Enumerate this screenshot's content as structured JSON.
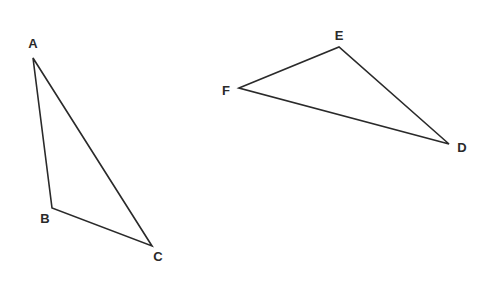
{
  "diagram": {
    "stroke_color": "#2a2a2a",
    "background": "#ffffff",
    "triangles": [
      {
        "name": "ABC",
        "vertices": [
          {
            "label": "A",
            "x": 33,
            "y": 58,
            "lx": 33,
            "ly": 48
          },
          {
            "label": "B",
            "x": 52,
            "y": 208,
            "lx": 45,
            "ly": 223
          },
          {
            "label": "C",
            "x": 152,
            "y": 246,
            "lx": 158,
            "ly": 261
          }
        ]
      },
      {
        "name": "DEF",
        "vertices": [
          {
            "label": "F",
            "x": 239,
            "y": 88,
            "lx": 226,
            "ly": 95
          },
          {
            "label": "E",
            "x": 339,
            "y": 47,
            "lx": 339,
            "ly": 40
          },
          {
            "label": "D",
            "x": 449,
            "y": 144,
            "lx": 462,
            "ly": 152
          }
        ]
      }
    ]
  }
}
